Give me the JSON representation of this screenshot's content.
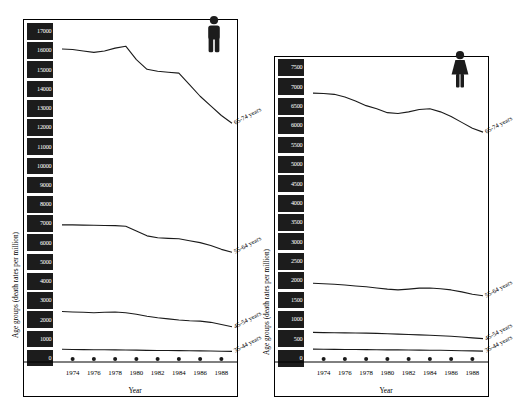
{
  "figure": {
    "background_color": "#ffffff",
    "line_color": "#1a1a1a",
    "tick_block_color": "#1c1c1c",
    "tick_text_color": "#ffffff"
  },
  "panels": [
    {
      "id": "male",
      "sex_icon_name": "male-figure-icon",
      "sex_label": "male",
      "y_axis_title": "Age groups (death rates per million)",
      "x_axis_title": "Year",
      "y_ticks": [
        "0",
        "1000",
        "2000",
        "3000",
        "4000",
        "5000",
        "6000",
        "7000",
        "8000",
        "9000",
        "10000",
        "11000",
        "12000",
        "13000",
        "14000",
        "15000",
        "16000",
        "17000"
      ],
      "x_ticks": [
        "1974",
        "1976",
        "1978",
        "1980",
        "1982",
        "1984",
        "1986",
        "1988"
      ],
      "series_labels": [
        "65-74 years",
        "55-64 years",
        "45-54 years",
        "35-44 years"
      ]
    },
    {
      "id": "female",
      "sex_icon_name": "female-figure-icon",
      "sex_label": "female",
      "y_axis_title": "Age groups (death rates per million)",
      "x_axis_title": "Year",
      "y_ticks": [
        "0",
        "500",
        "1000",
        "1500",
        "2000",
        "2500",
        "3000",
        "3500",
        "4000",
        "4500",
        "5000",
        "5500",
        "6000",
        "6500",
        "7000",
        "7500"
      ],
      "x_ticks": [
        "1974",
        "1976",
        "1978",
        "1980",
        "1982",
        "1984",
        "1986",
        "1988"
      ],
      "series_labels": [
        "65-74 years",
        "55-64 years",
        "45-54 years",
        "35-44 years"
      ]
    }
  ],
  "chart_data": [
    {
      "type": "line",
      "title": "",
      "subtitle": "male",
      "xlabel": "Year",
      "ylabel": "Age groups (death rates per million)",
      "xlim": [
        1973,
        1989
      ],
      "ylim": [
        0,
        17500
      ],
      "grid": false,
      "legend": "inline-end-of-line",
      "x": [
        1973,
        1974,
        1975,
        1976,
        1977,
        1978,
        1979,
        1980,
        1981,
        1982,
        1983,
        1984,
        1985,
        1986,
        1987,
        1988,
        1989
      ],
      "series": [
        {
          "name": "65-74 years",
          "values": [
            16250,
            16230,
            16150,
            16080,
            16150,
            16300,
            16400,
            15700,
            15200,
            15100,
            15050,
            15000,
            14400,
            13800,
            13300,
            12800,
            12400
          ]
        },
        {
          "name": "55-64 years",
          "values": [
            7120,
            7120,
            7110,
            7100,
            7090,
            7080,
            7050,
            6800,
            6550,
            6450,
            6420,
            6400,
            6300,
            6200,
            6050,
            5850,
            5700
          ]
        },
        {
          "name": "45-54 years",
          "values": [
            2620,
            2600,
            2580,
            2560,
            2580,
            2600,
            2560,
            2480,
            2380,
            2300,
            2240,
            2180,
            2140,
            2120,
            2060,
            1950,
            1830
          ]
        },
        {
          "name": "35-44 years",
          "values": [
            660,
            650,
            645,
            640,
            635,
            630,
            625,
            615,
            605,
            600,
            595,
            590,
            585,
            580,
            570,
            560,
            550
          ]
        }
      ],
      "markers_on_axis_row": true
    },
    {
      "type": "line",
      "title": "",
      "subtitle": "female",
      "xlabel": "Year",
      "ylabel": "Age groups (death rates per million)",
      "xlim": [
        1973,
        1989
      ],
      "ylim": [
        0,
        7700
      ],
      "grid": false,
      "legend": "inline-end-of-line",
      "x": [
        1973,
        1974,
        1975,
        1976,
        1977,
        1978,
        1979,
        1980,
        1981,
        1982,
        1983,
        1984,
        1985,
        1986,
        1987,
        1988,
        1989
      ],
      "series": [
        {
          "name": "65-74 years",
          "values": [
            6900,
            6890,
            6870,
            6800,
            6700,
            6580,
            6500,
            6400,
            6380,
            6420,
            6480,
            6500,
            6420,
            6300,
            6150,
            6000,
            5900
          ]
        },
        {
          "name": "55-64 years",
          "values": [
            2020,
            2010,
            1995,
            1975,
            1950,
            1930,
            1900,
            1870,
            1850,
            1870,
            1895,
            1900,
            1880,
            1850,
            1800,
            1740,
            1700
          ]
        },
        {
          "name": "45-54 years",
          "values": [
            760,
            755,
            750,
            748,
            745,
            742,
            735,
            725,
            715,
            705,
            695,
            685,
            675,
            660,
            640,
            620,
            600
          ]
        },
        {
          "name": "35-44 years",
          "values": [
            330,
            328,
            325,
            322,
            320,
            318,
            315,
            312,
            310,
            308,
            305,
            302,
            300,
            295,
            290,
            285,
            280
          ]
        }
      ],
      "markers_on_axis_row": true
    }
  ]
}
